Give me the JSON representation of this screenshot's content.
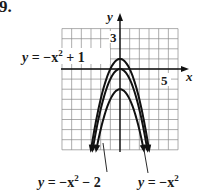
{
  "problem_number": "9.",
  "chart_data": {
    "type": "line",
    "title": "",
    "xlabel": "x",
    "ylabel": "y",
    "xlim": [
      -6,
      6
    ],
    "ylim": [
      -8,
      4
    ],
    "grid": true,
    "tick_labels": {
      "x": [
        "5"
      ],
      "y": [
        "3"
      ]
    },
    "series": [
      {
        "name": "y = -x^2 + 1",
        "label": "y = −x² + 1",
        "vertex": [
          0,
          1
        ],
        "x_range": [
          -3,
          3
        ]
      },
      {
        "name": "y = -x^2",
        "label": "y = −x²",
        "vertex": [
          0,
          0
        ],
        "x_range": [
          -2.83,
          2.83
        ]
      },
      {
        "name": "y = -x^2 - 2",
        "label": "y = −x² − 2",
        "vertex": [
          0,
          -2
        ],
        "x_range": [
          -2.45,
          2.45
        ]
      }
    ],
    "annotations": [
      {
        "text": "y = −x² + 1",
        "position": "left of graph, near vertex"
      },
      {
        "text": "y = −x² − 2",
        "position": "below graph, leader to inner curve"
      },
      {
        "text": "y = −x²",
        "position": "below graph right, leader to middle curve"
      }
    ]
  },
  "labels": {
    "x_axis": "x",
    "y_axis": "y",
    "x_tick": "5",
    "y_tick": "3",
    "eq1_lhs": "y",
    "eq1_rhs": " = −x",
    "eq1_tail": " + 1",
    "eq2_lhs": "y",
    "eq2_rhs": " = −x",
    "eq2_tail": " − 2",
    "eq3_lhs": "y",
    "eq3_rhs": " = −x",
    "sup": "2"
  },
  "colors": {
    "curve": "#111111",
    "grid": "#8a8a8a",
    "axis": "#111111",
    "text": "#1a1a1a"
  }
}
